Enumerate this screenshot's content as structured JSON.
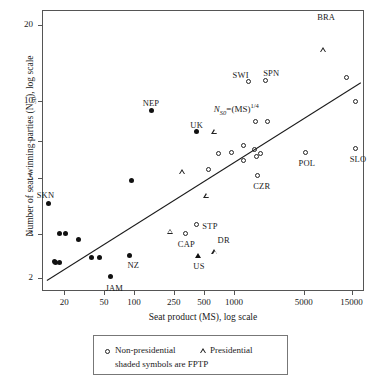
{
  "chart_data": {
    "type": "scatter",
    "title": "",
    "xlabel": "Seat product (MS), log scale",
    "ylabel_text": "Number of seat-winning parties (N",
    "ylabel_sub": "S0",
    "ylabel_tail": "), log scale",
    "xscale": "log",
    "yscale": "log",
    "xlim": [
      12,
      20000
    ],
    "ylim": [
      1.78,
      23
    ],
    "xticks": [
      20,
      50,
      100,
      250,
      500,
      1000,
      5000,
      15000
    ],
    "xticklabels": [
      "20",
      "50",
      "100",
      "250",
      "500",
      "1000",
      "5000",
      "15000"
    ],
    "yticks": [
      2,
      3,
      5,
      7,
      10,
      20
    ],
    "yticklabels": [
      "2",
      "3",
      "5",
      "7",
      "10",
      "20"
    ],
    "grid": false,
    "annotation": {
      "text_parts": [
        "N",
        "S0",
        "=(MS)",
        "1/4"
      ],
      "x": 1900,
      "y": 9.3
    },
    "fit_line": {
      "equation": "N_S0 = (MS)^(1/4)",
      "x_start": 13.5,
      "y_start": 1.97,
      "x_end": 18500,
      "y_end": 11.9
    },
    "legend": {
      "position": "below-axes",
      "entries": [
        {
          "marker": "open-circle",
          "label": "Non-presidential"
        },
        {
          "marker": "open-triangle",
          "label": "Presidential"
        }
      ],
      "note": "shaded symbols are FPTP"
    },
    "series": [
      {
        "name": "Non-presidential (open circle)",
        "marker": "open-circle",
        "points": [
          {
            "x": 700,
            "y": 6.2,
            "label": ""
          },
          {
            "x": 950,
            "y": 6.25,
            "label": ""
          },
          {
            "x": 1250,
            "y": 6.7,
            "label": ""
          },
          {
            "x": 1250,
            "y": 5.8,
            "label": ""
          },
          {
            "x": 1600,
            "y": 6.45,
            "label": ""
          },
          {
            "x": 1650,
            "y": 8.3,
            "label": ""
          },
          {
            "x": 2200,
            "y": 8.3,
            "label": ""
          },
          {
            "x": 1850,
            "y": 6.2,
            "label": ""
          },
          {
            "x": 1700,
            "y": 6.05,
            "label": ""
          },
          {
            "x": 1750,
            "y": 5.1,
            "label": "CZR"
          },
          {
            "x": 560,
            "y": 5.35,
            "label": ""
          },
          {
            "x": 420,
            "y": 3.25,
            "label": "STP"
          },
          {
            "x": 330,
            "y": 3.0,
            "label": "CAP"
          },
          {
            "x": 1400,
            "y": 12.0,
            "label": "SWI"
          },
          {
            "x": 2100,
            "y": 12.1,
            "label": "SPN"
          },
          {
            "x": 5200,
            "y": 6.25,
            "label": "POL"
          },
          {
            "x": 13500,
            "y": 12.4,
            "label": ""
          },
          {
            "x": 16500,
            "y": 10.0,
            "label": ""
          },
          {
            "x": 16500,
            "y": 6.5,
            "label": "SLO"
          }
        ]
      },
      {
        "name": "Presidential (open triangle)",
        "marker": "open-triangle",
        "points": [
          {
            "x": 640,
            "y": 7.6,
            "label": ""
          },
          {
            "x": 300,
            "y": 5.5,
            "label": ""
          },
          {
            "x": 530,
            "y": 4.65,
            "label": ""
          },
          {
            "x": 230,
            "y": 3.5,
            "label": ""
          },
          {
            "x": 640,
            "y": 3.05,
            "label": "DR"
          },
          {
            "x": 7800,
            "y": 20.0,
            "label": "BRA"
          }
        ]
      },
      {
        "name": "FPTP non-presidential (shaded circle)",
        "marker": "filled-circle",
        "points": [
          {
            "x": 14,
            "y": 3.95,
            "label": "SKN"
          },
          {
            "x": 18,
            "y": 3.0,
            "label": ""
          },
          {
            "x": 21,
            "y": 3.0,
            "label": ""
          },
          {
            "x": 28,
            "y": 2.85,
            "label": ""
          },
          {
            "x": 16,
            "y": 2.33,
            "label": ""
          },
          {
            "x": 16.5,
            "y": 2.3,
            "label": ""
          },
          {
            "x": 18,
            "y": 2.3,
            "label": ""
          },
          {
            "x": 38,
            "y": 2.4,
            "label": ""
          },
          {
            "x": 45,
            "y": 2.4,
            "label": ""
          },
          {
            "x": 58,
            "y": 2.02,
            "label": "JAM"
          },
          {
            "x": 90,
            "y": 2.45,
            "label": "NZ"
          },
          {
            "x": 150,
            "y": 9.2,
            "label": "NEP"
          },
          {
            "x": 420,
            "y": 7.6,
            "label": "UK"
          },
          {
            "x": 95,
            "y": 4.85,
            "label": ""
          }
        ]
      },
      {
        "name": "FPTP presidential (shaded triangle)",
        "marker": "filled-triangle",
        "points": [
          {
            "x": 430,
            "y": 2.45,
            "label": "US"
          }
        ]
      }
    ]
  }
}
